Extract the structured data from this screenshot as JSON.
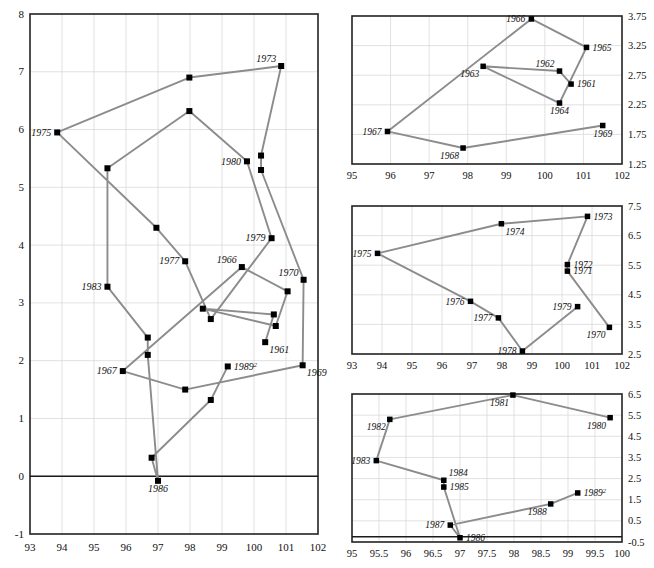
{
  "figure": {
    "title": "",
    "panel_count": 4,
    "marker_color": "#000000",
    "line_color": "#8c8c8c",
    "grid_color": "#d9d9d9",
    "frame_color": "#222222"
  },
  "chart_data": [
    {
      "id": "main-panel",
      "type": "line",
      "title": "",
      "xlabel": "",
      "ylabel": "",
      "xlim": [
        93,
        102
      ],
      "ylim": [
        -1,
        8
      ],
      "xticks": [
        93,
        94,
        95,
        96,
        97,
        98,
        99,
        100,
        101,
        102
      ],
      "xticklabels": [
        "93",
        "94",
        "95",
        "96",
        "97",
        "98",
        "99",
        "100",
        "101",
        "102"
      ],
      "yticks": [
        -1,
        0,
        1,
        2,
        3,
        4,
        5,
        6,
        7,
        8
      ],
      "yticklabels": [
        "-1",
        "0",
        "1",
        "2",
        "3",
        "4",
        "5",
        "6",
        "7",
        "8"
      ],
      "grid": true,
      "zero_line": 0,
      "legend": "none",
      "points": [
        {
          "label": "1961",
          "x": 100.35,
          "y": 2.32,
          "label_pos": "below-right"
        },
        {
          "label": "1962",
          "x": 100.62,
          "y": 2.8,
          "label_pos": "none"
        },
        {
          "label": "1963",
          "x": 98.4,
          "y": 2.9,
          "label_pos": "none"
        },
        {
          "label": "1964",
          "x": 100.68,
          "y": 2.6,
          "label_pos": "none"
        },
        {
          "label": "1965",
          "x": 101.05,
          "y": 3.2,
          "label_pos": "none"
        },
        {
          "label": "1966",
          "x": 99.62,
          "y": 3.62,
          "label_pos": "above-left"
        },
        {
          "label": "1967",
          "x": 95.9,
          "y": 1.82,
          "label_pos": "left"
        },
        {
          "label": "1968",
          "x": 97.85,
          "y": 1.5,
          "label_pos": "none"
        },
        {
          "label": "1969",
          "x": 101.52,
          "y": 1.92,
          "label_pos": "below-right"
        },
        {
          "label": "1970",
          "x": 101.55,
          "y": 3.4,
          "label_pos": "above-left"
        },
        {
          "label": "1971",
          "x": 100.22,
          "y": 5.3,
          "label_pos": "none"
        },
        {
          "label": "1972",
          "x": 100.22,
          "y": 5.55,
          "label_pos": "none"
        },
        {
          "label": "1973",
          "x": 100.85,
          "y": 7.1,
          "label_pos": "above-left"
        },
        {
          "label": "1974",
          "x": 97.98,
          "y": 6.9,
          "label_pos": "none"
        },
        {
          "label": "1975",
          "x": 93.85,
          "y": 5.95,
          "label_pos": "left"
        },
        {
          "label": "1976",
          "x": 96.95,
          "y": 4.3,
          "label_pos": "none"
        },
        {
          "label": "1977",
          "x": 97.85,
          "y": 3.72,
          "label_pos": "left"
        },
        {
          "label": "1978",
          "x": 98.65,
          "y": 2.72,
          "label_pos": "none"
        },
        {
          "label": "1979",
          "x": 100.55,
          "y": 4.12,
          "label_pos": "left"
        },
        {
          "label": "1980",
          "x": 99.78,
          "y": 5.45,
          "label_pos": "left"
        },
        {
          "label": "1981",
          "x": 97.98,
          "y": 6.32,
          "label_pos": "none"
        },
        {
          "label": "1982",
          "x": 95.42,
          "y": 5.33,
          "label_pos": "none"
        },
        {
          "label": "1983",
          "x": 95.42,
          "y": 3.28,
          "label_pos": "left"
        },
        {
          "label": "1984",
          "x": 96.68,
          "y": 2.4,
          "label_pos": "none"
        },
        {
          "label": "1985",
          "x": 96.68,
          "y": 2.1,
          "label_pos": "none"
        },
        {
          "label": "1986",
          "x": 97.0,
          "y": -0.08,
          "label_pos": "below"
        },
        {
          "label": "1987",
          "x": 96.8,
          "y": 0.32,
          "label_pos": "none"
        },
        {
          "label": "1988",
          "x": 98.65,
          "y": 1.32,
          "label_pos": "none"
        },
        {
          "label": "1989",
          "x": 99.18,
          "y": 1.9,
          "label_pos": "right",
          "sup": "2"
        }
      ],
      "path_order": [
        "1961",
        "1962",
        "1963",
        "1964",
        "1965",
        "1966",
        "1967",
        "1968",
        "1969",
        "1970",
        "1971",
        "1972",
        "1973",
        "1974",
        "1975",
        "1976",
        "1977",
        "1978",
        "1979",
        "1980",
        "1981",
        "1982",
        "1983",
        "1984",
        "1985",
        "1986",
        "1987",
        "1988",
        "1989"
      ]
    },
    {
      "id": "panel-1961-1969",
      "type": "line",
      "title": "",
      "xlabel": "",
      "ylabel": "",
      "xlim": [
        95,
        102
      ],
      "ylim": [
        1.25,
        3.75
      ],
      "xticks": [
        95,
        96,
        97,
        98,
        99,
        100,
        101,
        102
      ],
      "xticklabels": [
        "95",
        "96",
        "97",
        "98",
        "99",
        "100",
        "101",
        "102"
      ],
      "yticks": [
        1.25,
        1.75,
        2.25,
        2.75,
        3.25,
        3.75
      ],
      "yticklabels": [
        "1.25",
        "1.75",
        "2.25",
        "2.75",
        "3.25",
        "3.75"
      ],
      "grid": true,
      "legend": "none",
      "points": [
        {
          "label": "1961",
          "x": 100.68,
          "y": 2.6,
          "label_pos": "right"
        },
        {
          "label": "1962",
          "x": 100.38,
          "y": 2.82,
          "label_pos": "above-left"
        },
        {
          "label": "1963",
          "x": 98.4,
          "y": 2.9,
          "label_pos": "below-left"
        },
        {
          "label": "1964",
          "x": 100.38,
          "y": 2.28,
          "label_pos": "below"
        },
        {
          "label": "1965",
          "x": 101.08,
          "y": 3.22,
          "label_pos": "right"
        },
        {
          "label": "1966",
          "x": 99.65,
          "y": 3.7,
          "label_pos": "left"
        },
        {
          "label": "1967",
          "x": 95.92,
          "y": 1.8,
          "label_pos": "left"
        },
        {
          "label": "1968",
          "x": 97.88,
          "y": 1.52,
          "label_pos": "below-left"
        },
        {
          "label": "1969",
          "x": 101.5,
          "y": 1.9,
          "label_pos": "below"
        }
      ],
      "path_order": [
        "1961",
        "1962",
        "1963",
        "1964",
        "1965",
        "1966",
        "1967",
        "1968",
        "1969"
      ]
    },
    {
      "id": "panel-1970-1979",
      "type": "line",
      "title": "",
      "xlabel": "",
      "ylabel": "",
      "xlim": [
        93,
        102
      ],
      "ylim": [
        2.5,
        7.5
      ],
      "xticks": [
        93,
        94,
        95,
        96,
        97,
        98,
        99,
        100,
        101,
        102
      ],
      "xticklabels": [
        "93",
        "94",
        "95",
        "96",
        "97",
        "98",
        "99",
        "100",
        "101",
        "102"
      ],
      "yticks": [
        2.5,
        3.5,
        4.5,
        5.5,
        6.5,
        7.5
      ],
      "yticklabels": [
        "2.5",
        "3.5",
        "4.5",
        "5.5",
        "6.5",
        "7.5"
      ],
      "grid": true,
      "legend": "none",
      "points": [
        {
          "label": "1970",
          "x": 101.58,
          "y": 3.4,
          "label_pos": "below-left"
        },
        {
          "label": "1971",
          "x": 100.18,
          "y": 5.3,
          "label_pos": "right"
        },
        {
          "label": "1972",
          "x": 100.18,
          "y": 5.52,
          "label_pos": "right"
        },
        {
          "label": "1973",
          "x": 100.85,
          "y": 7.15,
          "label_pos": "right"
        },
        {
          "label": "1974",
          "x": 97.98,
          "y": 6.9,
          "label_pos": "below-right"
        },
        {
          "label": "1975",
          "x": 93.85,
          "y": 5.9,
          "label_pos": "left"
        },
        {
          "label": "1976",
          "x": 96.95,
          "y": 4.28,
          "label_pos": "left"
        },
        {
          "label": "1977",
          "x": 97.88,
          "y": 3.72,
          "label_pos": "left"
        },
        {
          "label": "1978",
          "x": 98.68,
          "y": 2.6,
          "label_pos": "left"
        },
        {
          "label": "1979",
          "x": 100.52,
          "y": 4.1,
          "label_pos": "left"
        }
      ],
      "path_order": [
        "1970",
        "1971",
        "1972",
        "1973",
        "1974",
        "1975",
        "1976",
        "1977",
        "1978",
        "1979"
      ]
    },
    {
      "id": "panel-1980-1989",
      "type": "line",
      "title": "",
      "xlabel": "",
      "ylabel": "",
      "xlim": [
        95,
        100
      ],
      "ylim": [
        -0.5,
        6.5
      ],
      "xticks": [
        95,
        95.5,
        96,
        96.5,
        97,
        97.5,
        98,
        98.5,
        99,
        99.5,
        100
      ],
      "xticklabels": [
        "95",
        "95.5",
        "96",
        "96.5",
        "97",
        "97.5",
        "98",
        "98.5",
        "99",
        "99.5",
        "100"
      ],
      "yticks": [
        -0.5,
        0.5,
        1.5,
        2.5,
        3.5,
        4.5,
        5.5,
        6.5
      ],
      "yticklabels": [
        "-0.5",
        "0.5",
        "1.5",
        "2.5",
        "3.5",
        "4.5",
        "5.5",
        "6.5"
      ],
      "grid": true,
      "zero_line": -0.25,
      "legend": "none",
      "points": [
        {
          "label": "1980",
          "x": 99.78,
          "y": 5.38,
          "label_pos": "below-left"
        },
        {
          "label": "1981",
          "x": 97.98,
          "y": 6.45,
          "label_pos": "below-left"
        },
        {
          "label": "1982",
          "x": 95.7,
          "y": 5.3,
          "label_pos": "below-left"
        },
        {
          "label": "1983",
          "x": 95.45,
          "y": 3.35,
          "label_pos": "left"
        },
        {
          "label": "1984",
          "x": 96.7,
          "y": 2.42,
          "label_pos": "above-right"
        },
        {
          "label": "1985",
          "x": 96.7,
          "y": 2.1,
          "label_pos": "right"
        },
        {
          "label": "1986",
          "x": 97.0,
          "y": -0.3,
          "label_pos": "right"
        },
        {
          "label": "1987",
          "x": 96.82,
          "y": 0.3,
          "label_pos": "left"
        },
        {
          "label": "1988",
          "x": 98.68,
          "y": 1.3,
          "label_pos": "below-left"
        },
        {
          "label": "1989",
          "x": 99.18,
          "y": 1.82,
          "label_pos": "right",
          "sup": "2"
        }
      ],
      "path_order": [
        "1980",
        "1981",
        "1982",
        "1983",
        "1984",
        "1985",
        "1986",
        "1987",
        "1988",
        "1989"
      ]
    }
  ]
}
